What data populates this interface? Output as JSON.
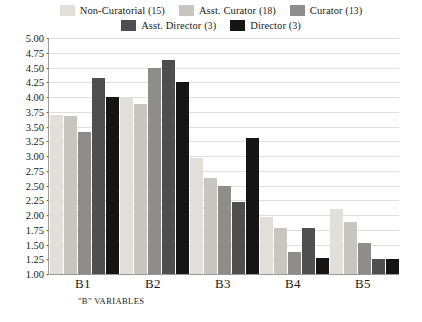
{
  "chart_data": {
    "type": "bar",
    "title": "",
    "xlabel": "\"B\" VARIABLES",
    "ylabel": "",
    "categories": [
      "B1",
      "B2",
      "B3",
      "B4",
      "B5"
    ],
    "ylim": [
      1.0,
      5.0
    ],
    "ytick_step": 0.25,
    "yticks": [
      "5.00",
      "4.75",
      "4.50",
      "4.25",
      "4.00",
      "3.75",
      "3.50",
      "3.25",
      "3.00",
      "2.75",
      "2.50",
      "2.25",
      "2.00",
      "1.75",
      "1.50",
      "1.25",
      "1.00"
    ],
    "grid": true,
    "legend_position": "top",
    "series": [
      {
        "name": "Non-Curatorial",
        "count": "15",
        "color": "#e2dfda",
        "values": [
          3.7,
          4.0,
          2.97,
          1.97,
          2.1
        ]
      },
      {
        "name": "Asst. Curator",
        "count": "18",
        "color": "#c9c6c1",
        "values": [
          3.68,
          3.88,
          2.62,
          1.78,
          1.88
        ]
      },
      {
        "name": "Curator",
        "count": "13",
        "color": "#8e8d8b",
        "values": [
          3.4,
          4.5,
          2.5,
          1.38,
          1.52
        ]
      },
      {
        "name": "Asst. Director",
        "count": "3",
        "color": "#4f4f4f",
        "values": [
          4.33,
          4.62,
          2.22,
          1.78,
          1.25
        ]
      },
      {
        "name": "Director",
        "count": "3",
        "color": "#151515",
        "values": [
          4.0,
          4.25,
          3.3,
          1.27,
          1.25
        ]
      }
    ]
  }
}
